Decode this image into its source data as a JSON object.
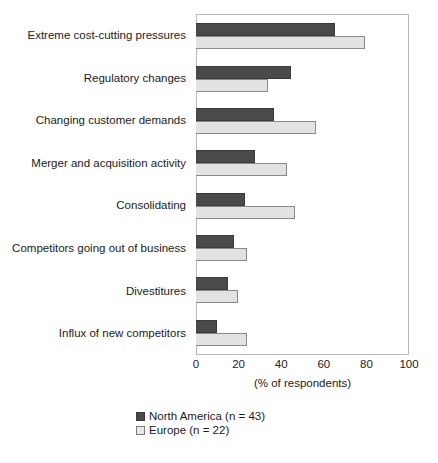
{
  "chart_data": {
    "type": "bar",
    "orientation": "horizontal",
    "title": "",
    "xlabel": "(% of respondents)",
    "ylabel": "",
    "xlim": [
      0,
      100
    ],
    "xticks": [
      0,
      20,
      40,
      60,
      80,
      100
    ],
    "grid": false,
    "legend_position": "bottom-center",
    "categories": [
      "Extreme cost-cutting pressures",
      "Regulatory changes",
      "Changing customer demands",
      "Merger and acquisition activity",
      "Consolidating",
      "Competitors going out of business",
      "Divestitures",
      "Influx of new competitors"
    ],
    "series": [
      {
        "name": "North America (n = 43)",
        "color": "#4a4a4a",
        "values": [
          66,
          45,
          37,
          28,
          23,
          18,
          15,
          10
        ]
      },
      {
        "name": "Europe (n = 22)",
        "color": "#e2e2e2",
        "values": [
          80,
          34,
          57,
          43,
          47,
          24,
          20,
          24
        ]
      }
    ]
  }
}
